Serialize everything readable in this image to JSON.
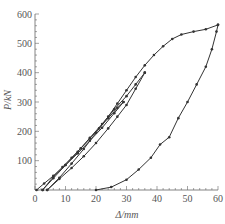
{
  "chart_data": {
    "type": "line",
    "title": "",
    "xlabel": "Δ/mm",
    "ylabel": "P/kN",
    "xlim": [
      0,
      60
    ],
    "ylim": [
      0,
      600
    ],
    "xticks": [
      0,
      10,
      20,
      30,
      40,
      50,
      60
    ],
    "yticks": [
      0,
      100,
      200,
      300,
      400,
      500,
      600
    ],
    "grid": false,
    "legend": null,
    "line_color": "#333333",
    "series": [
      {
        "name": "cycle-1-loading",
        "x": [
          0.5,
          3,
          6,
          9,
          12,
          15,
          18,
          21,
          24,
          27,
          29
        ],
        "y": [
          0,
          22,
          48,
          78,
          110,
          142,
          176,
          210,
          245,
          280,
          300
        ]
      },
      {
        "name": "cycle-1-unloading",
        "x": [
          29,
          26,
          22,
          18,
          14,
          10,
          6,
          2.5
        ],
        "y": [
          300,
          262,
          212,
          168,
          125,
          85,
          45,
          0
        ]
      },
      {
        "name": "cycle-2-loading",
        "x": [
          2.5,
          6,
          10,
          14,
          18,
          22,
          26,
          30,
          33,
          36
        ],
        "y": [
          0,
          40,
          85,
          130,
          178,
          225,
          275,
          320,
          360,
          400
        ]
      },
      {
        "name": "cycle-2-unloading",
        "x": [
          36,
          33,
          30,
          27,
          24,
          20,
          16,
          12,
          8,
          4
        ],
        "y": [
          400,
          345,
          290,
          250,
          210,
          160,
          115,
          75,
          38,
          0
        ]
      },
      {
        "name": "envelope-loading",
        "x": [
          4,
          8,
          12,
          16,
          20,
          24,
          27,
          30,
          33,
          36,
          39,
          42,
          45,
          48,
          52,
          56,
          60
        ],
        "y": [
          0,
          42,
          90,
          140,
          195,
          250,
          295,
          340,
          385,
          425,
          460,
          490,
          515,
          530,
          540,
          548,
          563
        ]
      },
      {
        "name": "final-unloading",
        "x": [
          60,
          59.5,
          58,
          56,
          53,
          50,
          47,
          44,
          41,
          38,
          34,
          30,
          25,
          20
        ],
        "y": [
          563,
          540,
          480,
          420,
          360,
          300,
          245,
          180,
          155,
          110,
          70,
          35,
          10,
          0
        ]
      }
    ]
  }
}
